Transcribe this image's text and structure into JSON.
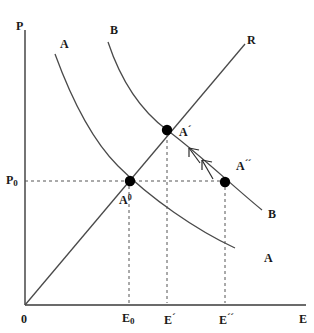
{
  "figure": {
    "type": "economics-equilibrium-diagram",
    "background_color": "#ffffff",
    "line_color": "#3a3a3a",
    "point_color": "#000000",
    "dash_color": "#555555",
    "width": 314,
    "height": 333
  },
  "axes": {
    "y_axis_label": "P",
    "x_axis_label": "E",
    "origin_label": "0",
    "y_tick_labels": [
      "P₀"
    ],
    "x_tick_labels": [
      "E₀",
      "E´",
      "E´´"
    ],
    "x_range_px": [
      25,
      305
    ],
    "y_range_px": [
      30,
      305
    ]
  },
  "curves": [
    {
      "name": "A",
      "kind": "downward-sloping",
      "start_label": "A",
      "end_label": "A",
      "start_label_pos": [
        62,
        44
      ],
      "end_label_pos": [
        266,
        252
      ]
    },
    {
      "name": "B",
      "kind": "downward-sloping",
      "start_label": "B",
      "end_label": "B",
      "start_label_pos": [
        112,
        26
      ],
      "end_label_pos": [
        270,
        209
      ]
    },
    {
      "name": "R",
      "kind": "ray-from-origin",
      "end_label": "R",
      "end_label_pos": [
        248,
        36
      ]
    }
  ],
  "points": [
    {
      "label": "A⁰",
      "label_html": "A0",
      "x_px": 130,
      "y_px": 181,
      "label_pos": [
        122,
        198
      ],
      "on": "A and B and R"
    },
    {
      "label": "A´",
      "label_html": "A'",
      "x_px": 167,
      "y_px": 130,
      "label_pos": [
        180,
        124
      ],
      "on": "B and R"
    },
    {
      "label": "A´´",
      "label_html": "A''",
      "x_px": 225,
      "y_px": 182,
      "label_pos": [
        238,
        158
      ],
      "on": "B"
    }
  ],
  "guides": {
    "horizontal_dashed_y_px": 181,
    "vertical_dashed_x_px": [
      128,
      167,
      224
    ],
    "price_level_label": "P₀"
  },
  "annotations": [
    {
      "name": "shift-arrow-upper",
      "direction": "up-left",
      "description": "arrow pointing from A´´ toward A´ along curve B"
    },
    {
      "name": "shift-arrow-lower",
      "direction": "up-left",
      "description": "second arrow pointing from A´´ toward A´ along curve B"
    }
  ],
  "labels": {
    "p_axis": "P",
    "e_axis": "E",
    "origin": "0",
    "p_zero": "P",
    "p_zero_sub": "0",
    "e_zero": "E",
    "e_zero_sub": "0",
    "e_prime": "E",
    "e_prime_mark": "´",
    "e_double_prime": "E",
    "e_double_prime_mark": "´´",
    "a_left_top": "A",
    "a_right_bottom": "A",
    "b_left_top": "B",
    "b_right_bottom": "B",
    "r_top_right": "R",
    "a_zero": "A",
    "a_zero_sup": "0",
    "a_prime": "A",
    "a_prime_mark": "´",
    "a_double_prime": "A",
    "a_double_prime_mark": "´´"
  }
}
